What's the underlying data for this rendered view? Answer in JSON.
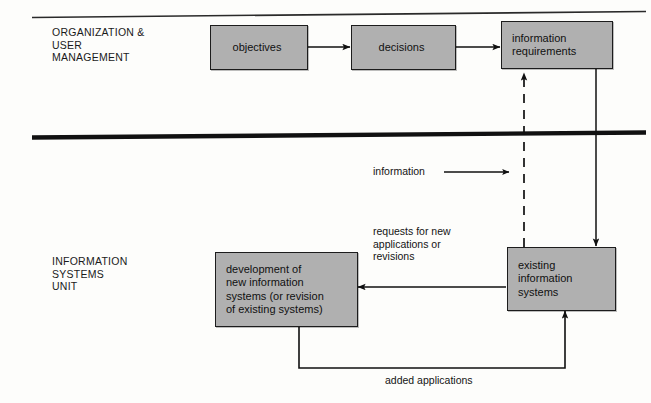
{
  "diagram": {
    "bands": [
      {
        "id": "organization-user-management",
        "label": "ORGANIZATION &\nUSER\nMANAGEMENT"
      },
      {
        "id": "information-systems-unit",
        "label": "INFORMATION\nSYSTEMS\nUNIT"
      }
    ],
    "nodes": [
      {
        "id": "objectives",
        "label": "objectives",
        "band": "organization-user-management"
      },
      {
        "id": "decisions",
        "label": "decisions",
        "band": "organization-user-management"
      },
      {
        "id": "information-requirements",
        "label": "information\nrequirements",
        "band": "organization-user-management"
      },
      {
        "id": "development-of-new-information-systems",
        "label": "development of\nnew information\nsystems (or revision\nof existing systems)",
        "band": "information-systems-unit"
      },
      {
        "id": "existing-information-systems",
        "label": "existing\ninformation\nsystems",
        "band": "information-systems-unit"
      }
    ],
    "edge_labels": [
      {
        "id": "information",
        "label": "information"
      },
      {
        "id": "requests-for-new-applications-or-revisions",
        "label": "requests for new\napplications or\nrevisions"
      },
      {
        "id": "added-applications",
        "label": "added applications"
      }
    ],
    "colors": {
      "box_fill": "#b0b0b0",
      "box_stroke": "#1c1c1c",
      "line": "#101010",
      "text": "#111111",
      "background": "#fdfdfb"
    }
  }
}
